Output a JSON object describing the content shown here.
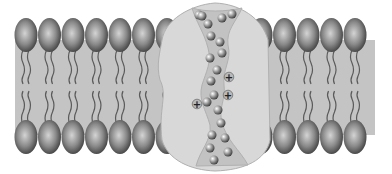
{
  "diagram": {
    "title": "",
    "colors": {
      "background": "#ffffff",
      "bilayer_core": "#c4c4c4",
      "lipid_head_dark": "#4a4a4a",
      "lipid_head_light": "#c8c8c8",
      "lipid_tail": "#5a5a5a",
      "protein": "#d8d8d8",
      "protein_outline": "#b0b0b0",
      "channel_pore": "#c2c2c2"
    },
    "lipids": {
      "top_row_count": 15,
      "bottom_row_count": 15
    },
    "channel": {
      "ions_plus_symbol": "+",
      "cation_count": 3,
      "water_molecule_count": 20
    }
  }
}
